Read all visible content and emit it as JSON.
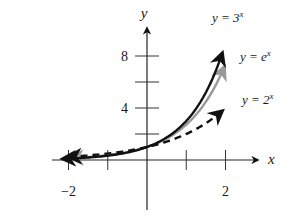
{
  "chart_data": {
    "type": "line",
    "title": "",
    "xlabel": "x",
    "ylabel": "y",
    "xlim": [
      -2.2,
      2.6
    ],
    "ylim": [
      0,
      10
    ],
    "grid": false,
    "x_ticks": [
      -2,
      -1,
      1,
      2
    ],
    "x_tick_labels": [
      {
        "value": -2,
        "label": "−2"
      },
      {
        "value": 2,
        "label": "2"
      }
    ],
    "y_ticks": [
      2,
      4,
      6,
      8
    ],
    "y_tick_labels": [
      {
        "value": 4,
        "label": "4"
      },
      {
        "value": 8,
        "label": "8"
      }
    ],
    "legend_position": "inline-right-of-curves",
    "series": [
      {
        "name": "y = 3^x",
        "label_base": "y = 3",
        "label_exp": "x",
        "function": "3^x",
        "color": "#111111",
        "style": "solid",
        "x_range": [
          -2.15,
          1.92
        ],
        "x": [
          -2,
          -1,
          0,
          1,
          1.5,
          1.9
        ],
        "values": [
          0.11,
          0.33,
          1,
          3,
          5.2,
          8.06
        ]
      },
      {
        "name": "y = e^x",
        "label_base": "y = e",
        "label_exp": "x",
        "function": "e^x",
        "color": "#999999",
        "style": "solid",
        "x_range": [
          -1.95,
          1.97
        ],
        "x": [
          -2,
          -1,
          0,
          1,
          1.5,
          1.95
        ],
        "values": [
          0.14,
          0.37,
          1,
          2.72,
          4.48,
          7.03
        ]
      },
      {
        "name": "y = 2^x",
        "label_base": "y = 2",
        "label_exp": "x",
        "function": "2^x",
        "color": "#111111",
        "style": "dashed",
        "x_range": [
          -2.0,
          1.92
        ],
        "x": [
          -2,
          -1,
          0,
          1,
          1.5,
          1.9
        ],
        "values": [
          0.25,
          0.5,
          1,
          2,
          2.83,
          3.73
        ]
      }
    ]
  }
}
